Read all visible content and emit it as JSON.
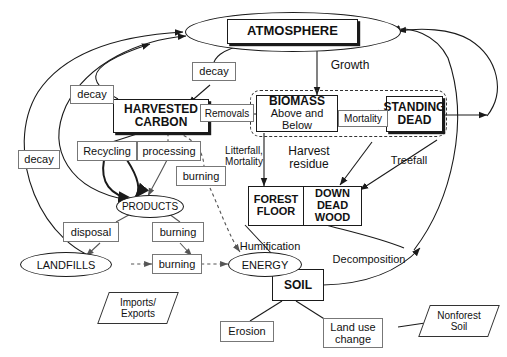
{
  "diagram": {
    "background": "#ffffff",
    "line_color": "#1a1a1a"
  },
  "pools": {
    "atmosphere": "ATMOSPHERE",
    "harvested_carbon_line1": "HARVESTED",
    "harvested_carbon_line2": "CARBON",
    "biomass_line1": "BIOMASS",
    "biomass_line2": "Above and Below",
    "standing_dead_line1": "STANDING",
    "standing_dead_line2": "DEAD",
    "forest_floor_line1": "FOREST",
    "forest_floor_line2": "FLOOR",
    "down_dead_wood_line1": "DOWN",
    "down_dead_wood_line2": "DEAD",
    "down_dead_wood_line3": "WOOD",
    "soil": "SOIL",
    "products": "PRODUCTS",
    "landfills": "LANDFILLS",
    "energy": "ENERGY"
  },
  "external": {
    "imports_exports_line1": "Imports/",
    "imports_exports_line2": "Exports",
    "nonforest_soil_line1": "Nonforest",
    "nonforest_soil_line2": "Soil"
  },
  "flux_labels": {
    "decay_left": "decay",
    "decay_mid": "decay",
    "decay_top": "decay",
    "removals": "Removals",
    "growth": "Growth",
    "mortality": "Mortality",
    "litterfall_line1": "Litterfall,",
    "litterfall_line2": "Mortality",
    "harvest_residue_line1": "Harvest",
    "harvest_residue_line2": "residue",
    "treefall": "Treefall",
    "recycling": "Recycling",
    "processing": "processing",
    "burning_products": "burning",
    "burning_right": "burning",
    "burning_landfill": "burning",
    "disposal": "disposal",
    "humification": "Humification",
    "decomposition": "Decomposition",
    "erosion": "Erosion",
    "land_use_change_line1": "Land use",
    "land_use_change_line2": "change"
  }
}
